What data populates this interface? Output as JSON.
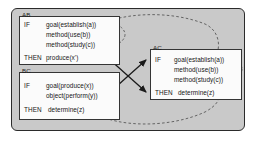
{
  "diagram": {
    "frame": {
      "background_color": "#c9c9c9",
      "border_color": "#2b2b2b"
    },
    "rules": [
      {
        "id": "AB",
        "label": "AB",
        "if_keyword": "IF",
        "then_keyword": "THEN",
        "conditions": [
          "goal(establish(a))",
          "method(use(b))",
          "method(study(c))"
        ],
        "action": "produce(x')",
        "conditions_grouped": true,
        "action_grouped": false
      },
      {
        "id": "BC",
        "label": "BC",
        "if_keyword": "IF",
        "then_keyword": "THEN",
        "conditions": [
          "goal(produce(x))",
          "object(perform(y))"
        ],
        "action": "determine(z)",
        "conditions_grouped": false,
        "action_grouped": true
      },
      {
        "id": "AC",
        "label": "AC",
        "if_keyword": "IF",
        "then_keyword": "THEN",
        "conditions": [
          "goal(establish(a))",
          "method(use(b))",
          "method(study(c))"
        ],
        "action": "determine(z)",
        "conditions_grouped": true,
        "action_grouped": true
      }
    ],
    "connectors": {
      "ellipse_style": "dashed",
      "ellipse_color": "#4a4a4a",
      "arrow_color": "#1a1a1a",
      "arrows": [
        {
          "from": "BC-conditions",
          "to": "AC-conditions",
          "direction": "up-right"
        },
        {
          "from": "AB-conditions",
          "to": "AC-action",
          "direction": "down-right"
        }
      ],
      "curves": [
        {
          "from": "AB-conditions-ellipse",
          "to": "AC-conditions-ellipse",
          "position": "top"
        },
        {
          "from": "BC-action-ellipse",
          "to": "AC-action-ellipse",
          "position": "bottom"
        }
      ]
    }
  }
}
